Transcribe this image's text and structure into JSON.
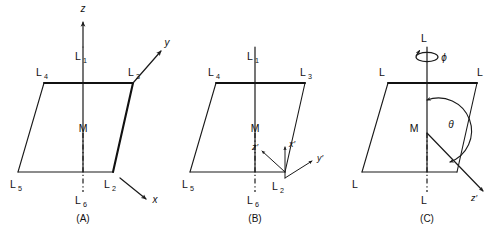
{
  "figure": {
    "background_color": "#ffffff",
    "line_color": "#1a1a1a",
    "panels": [
      {
        "id": "A",
        "caption": "(A)",
        "vertical_axis_label": "z",
        "ligand_labels": {
          "top_axial": "L",
          "top_axial_sub": "1",
          "bottom_axial": "L",
          "bottom_axial_sub": "6",
          "corner_back_left": "L",
          "corner_back_left_sub": "4",
          "corner_back_right": "L",
          "corner_back_right_sub": "3",
          "corner_front_left": "L",
          "corner_front_left_sub": "5",
          "corner_front_right": "L",
          "corner_front_right_sub": "2"
        },
        "metal_label": "M",
        "axes": [
          {
            "name": "z",
            "label": "z",
            "direction": "up"
          },
          {
            "name": "y",
            "label": "y",
            "direction": "up-right"
          },
          {
            "name": "x",
            "label": "x",
            "direction": "down-right"
          }
        ]
      },
      {
        "id": "B",
        "caption": "(B)",
        "ligand_labels": {
          "top_axial": "L",
          "top_axial_sub": "1",
          "bottom_axial": "L",
          "bottom_axial_sub": "6",
          "corner_back_left": "L",
          "corner_back_left_sub": "4",
          "corner_back_right": "L",
          "corner_back_right_sub": "3",
          "corner_front_left": "L",
          "corner_front_left_sub": "5",
          "corner_front_right": "L",
          "corner_front_right_sub": "2"
        },
        "metal_label": "M",
        "axes": [
          {
            "name": "z-prime",
            "label": "z′",
            "direction": "up-left"
          },
          {
            "name": "x-prime",
            "label": "x′",
            "direction": "up"
          },
          {
            "name": "y-prime",
            "label": "y′",
            "direction": "up-right"
          }
        ]
      },
      {
        "id": "C",
        "caption": "(C)",
        "ligand_labels": {
          "top_axial": "L",
          "bottom_axial": "L",
          "corner_back_left": "L",
          "corner_back_right": "L",
          "corner_front_left": "L",
          "corner_front_right": "L"
        },
        "metal_label": "M",
        "angles": [
          {
            "name": "phi",
            "label": "ϕ",
            "type": "rotation-about-axis"
          },
          {
            "name": "theta",
            "label": "θ",
            "type": "polar-angle"
          }
        ],
        "axes": [
          {
            "name": "z-prime",
            "label": "z′",
            "direction": "down-right"
          }
        ]
      }
    ]
  }
}
